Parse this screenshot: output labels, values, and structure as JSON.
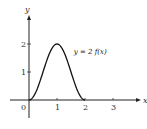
{
  "chart_data": {
    "type": "line",
    "title": "",
    "xlabel": "x",
    "ylabel": "y",
    "xlim": [
      -1,
      4
    ],
    "ylim": [
      -0.3,
      3.1
    ],
    "grid": false,
    "x_ticks": [
      1,
      2,
      3
    ],
    "x_tick_labels": [
      "1",
      "2",
      "3"
    ],
    "y_ticks": [
      1,
      2
    ],
    "y_tick_labels": [
      "1",
      "2"
    ],
    "origin_label": "0",
    "series": [
      {
        "name": "y = 2 f(x)",
        "description": "smooth bump, zero at x=0 and x=2, maximum 2 at x=1",
        "x": [
          0,
          0.25,
          0.5,
          0.75,
          1,
          1.25,
          1.5,
          1.75,
          2
        ],
        "y": [
          0,
          0.3,
          1.0,
          1.7,
          2,
          1.7,
          1.0,
          0.3,
          0
        ]
      }
    ],
    "annotations": [
      {
        "text": "y = 2 f(x)",
        "x": 1.6,
        "y": 1.65
      }
    ]
  }
}
